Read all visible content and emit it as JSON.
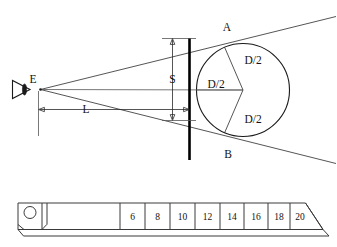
{
  "figure": {
    "labels": {
      "eye_point": "E",
      "tangent_top_point": "A",
      "tangent_bottom_point": "B",
      "gap_dimension": "S",
      "distance_dimension": "L",
      "radius_top": "D/2",
      "radius_center": "D/2",
      "radius_bottom": "D/2"
    },
    "icons": {
      "eye": "eye-icon",
      "ruler_hole": "ruler-hole-icon"
    },
    "colors": {
      "line": "#2a2a2a",
      "heavy_line": "#000000",
      "background": "#ffffff"
    }
  },
  "ruler": {
    "name": "measuring-ruler",
    "tick_labels": [
      "6",
      "8",
      "10",
      "12",
      "14",
      "16",
      "18",
      "20"
    ]
  }
}
